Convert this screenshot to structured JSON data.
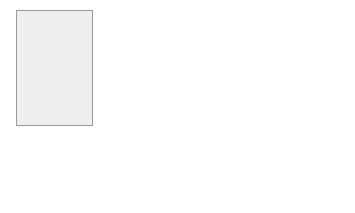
{
  "train": {
    "label": "Train",
    "normal_subjects_top": "Normal subjects",
    "motion_label_line1": "Normalized",
    "motion_label_line2": "Motion-captured data",
    "manifold_learning": "Manifold Learning",
    "view_invariant_manifold": "View-Invariant Manifold",
    "input_line1": "Input",
    "input_line2": "(heatmaps & body limb-maps)",
    "normal_subjects_bottom": "Normal subjects",
    "cnn_regression": "CNN Regression"
  },
  "model_box": {
    "line1": "Model",
    "line2": "Spatio-temporal",
    "line3": "Information"
  },
  "test": {
    "label": "Test",
    "input_line1": "Input",
    "input_line2": "(heatmaps & body limb-maps)",
    "subjects_line1": "Normal and",
    "subjects_line2": "Abnormal subjects",
    "cnn_regression": "CNN Regression",
    "cnn_sub": "(View-Invariant Pose Estimation)"
  },
  "quality_assessment": "Quality Assessment",
  "colors": {
    "panel_bg": "#efefef",
    "box_gray": "#8c8c8c",
    "box_dark": "#7a7a7a"
  }
}
